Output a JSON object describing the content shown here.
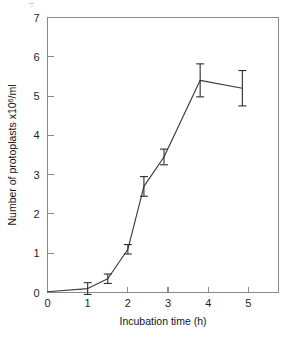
{
  "figure": {
    "background_color": "#ffffff",
    "line_color": "#3b3b3b",
    "axis_color": "#8a8a8a",
    "error_bar_color": "#2e2e2e"
  },
  "axes": {
    "y_label_prefix": "Number of protoplasts x10",
    "y_label_exponent": "6",
    "y_label_suffix": "/ml",
    "x_label": "Incubation time (h)",
    "y_ticks": [
      "0",
      "1",
      "2",
      "3",
      "4",
      "5",
      "6",
      "7"
    ],
    "x_ticks": [
      "0",
      "1",
      "2",
      "3",
      "4",
      "5"
    ]
  },
  "chart_data": {
    "type": "line",
    "title": "",
    "subtitle": "",
    "xlabel": "Incubation time (h)",
    "ylabel": "Number of protoplasts x10^6/ml",
    "xlim": [
      0,
      5.75
    ],
    "ylim": [
      0,
      7
    ],
    "xticks": [
      0,
      1,
      2,
      3,
      4,
      5
    ],
    "yticks": [
      0,
      1,
      2,
      3,
      4,
      5,
      6,
      7
    ],
    "grid": false,
    "legend": "none",
    "markers": "none",
    "error_bars": "vertical",
    "x": [
      0,
      1,
      1.5,
      2,
      2.4,
      2.9,
      3.8,
      4.85
    ],
    "y": [
      0.02,
      0.1,
      0.35,
      1.1,
      2.7,
      3.45,
      5.4,
      5.2
    ],
    "yerr": [
      0.0,
      0.15,
      0.12,
      0.12,
      0.25,
      0.2,
      0.42,
      0.45
    ],
    "series": [
      {
        "name": "Protoplast yield",
        "points": [
          {
            "x": 0,
            "y": 0.02,
            "yerr": 0.0
          },
          {
            "x": 1,
            "y": 0.1,
            "yerr": 0.15
          },
          {
            "x": 1.5,
            "y": 0.35,
            "yerr": 0.12
          },
          {
            "x": 2,
            "y": 1.1,
            "yerr": 0.12
          },
          {
            "x": 2.4,
            "y": 2.7,
            "yerr": 0.25
          },
          {
            "x": 2.9,
            "y": 3.45,
            "yerr": 0.2
          },
          {
            "x": 3.8,
            "y": 5.4,
            "yerr": 0.42
          },
          {
            "x": 4.85,
            "y": 5.2,
            "yerr": 0.45
          }
        ]
      }
    ]
  }
}
